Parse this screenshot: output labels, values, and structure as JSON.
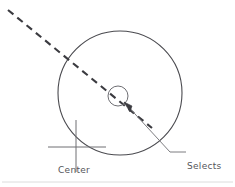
{
  "figure": {
    "width": 235,
    "height": 187,
    "background_color": "#ffffff",
    "line_color": "#4a4a4f",
    "text_color": "#55555a",
    "footer_rule_color": "#d8d8d8"
  },
  "labels": {
    "center": "Center",
    "selects_line1": "Selects",
    "selects_line2": "center",
    "selects_line3": "point",
    "selects_full": "Selects center point"
  },
  "geometry": {
    "main_circle": {
      "name": "main-circle",
      "cx": 120,
      "cy": 93,
      "r": 62,
      "stroke": "#4a4a4f",
      "stroke_width": 1.1,
      "fill": "none"
    },
    "pick_circle": {
      "name": "pick-aperture-circle",
      "cx": 118,
      "cy": 96,
      "r": 10,
      "stroke": "#6e6e73",
      "stroke_width": 1,
      "fill": "none"
    },
    "dashed_line": {
      "name": "dashed-construction-line",
      "x1": 8,
      "y1": 10,
      "x2": 152,
      "y2": 128,
      "stroke": "#3b3b40",
      "stroke_width": 2.1,
      "dash": "7 5"
    },
    "crosshair": {
      "name": "center-crosshair",
      "cx": 76,
      "cy": 147,
      "h_x1": 48,
      "h_x2": 106,
      "v_y1": 120,
      "v_y2": 172,
      "stroke": "#6e6e73",
      "stroke_width": 1
    },
    "leader": {
      "name": "leader-line",
      "arrow_x": 124,
      "arrow_y": 102,
      "elbow_x": 170,
      "elbow_y": 152,
      "end_x": 186,
      "end_y": 152,
      "stroke": "#6e6e73",
      "stroke_width": 0.9
    },
    "footer_rule": {
      "name": "footer-rule",
      "x1": 2,
      "x2": 233,
      "y": 182,
      "stroke": "#dcdcdc",
      "stroke_width": 1
    }
  }
}
